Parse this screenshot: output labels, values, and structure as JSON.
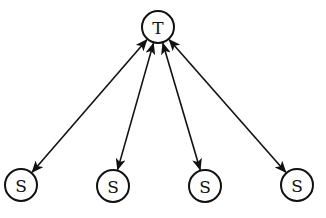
{
  "diagram": {
    "type": "star-network",
    "colors": {
      "stroke": "#111111",
      "fill": "#ffffff",
      "background": "#ffffff"
    },
    "nodes": [
      {
        "id": "T",
        "label": "T",
        "cx": 158,
        "cy": 27,
        "r": 16
      },
      {
        "id": "S1",
        "label": "S",
        "cx": 21,
        "cy": 185,
        "r": 16
      },
      {
        "id": "S2",
        "label": "S",
        "cx": 113,
        "cy": 186,
        "r": 16
      },
      {
        "id": "S3",
        "label": "S",
        "cx": 205,
        "cy": 186,
        "r": 16
      },
      {
        "id": "S4",
        "label": "S",
        "cx": 297,
        "cy": 185,
        "r": 16
      }
    ],
    "edges": [
      {
        "from": "T",
        "to": "S1",
        "direction": "both"
      },
      {
        "from": "T",
        "to": "S2",
        "direction": "both"
      },
      {
        "from": "T",
        "to": "S3",
        "direction": "both"
      },
      {
        "from": "T",
        "to": "S4",
        "direction": "both"
      }
    ]
  }
}
